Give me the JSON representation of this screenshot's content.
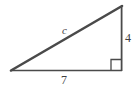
{
  "figure": {
    "name": "right-triangle",
    "background_color": "#ffffff",
    "stroke_color": "#4a4a4a",
    "label_color": "#3f3f3f"
  },
  "labels": {
    "hypotenuse": "c",
    "vertical_leg": "4",
    "base": "7"
  },
  "geometry": {
    "vertices": {
      "left": [
        11,
        71
      ],
      "bottom_right": [
        122,
        71
      ],
      "top_right": [
        122,
        6
      ]
    },
    "right_angle_marker": {
      "corner": "bottom-right",
      "size": 10
    }
  },
  "icons": {
    "right_angle_marker": "right-angle-icon"
  }
}
